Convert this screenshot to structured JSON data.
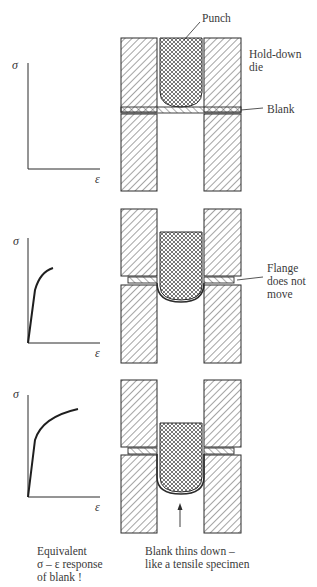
{
  "labels": {
    "punch": "Punch",
    "hold_down_die_line1": "Hold-down",
    "hold_down_die_line2": "die",
    "blank": "Blank",
    "flange_line1": "Flange",
    "flange_line2": "does not",
    "flange_line3": "move"
  },
  "graphs": [
    {
      "y_label": "σ",
      "x_label": "ε",
      "curve": "none"
    },
    {
      "y_label": "σ",
      "x_label": "ε",
      "curve": "partial stress-strain"
    },
    {
      "y_label": "σ",
      "x_label": "ε",
      "curve": "full stress-strain"
    }
  ],
  "captions": {
    "left_line1": "Equivalent",
    "left_line2": "σ – ε response",
    "left_line3": "of blank !",
    "right_line1": "Blank thins down –",
    "right_line2": "like a tensile specimen"
  },
  "stages": [
    {
      "name": "initial",
      "punch_depth": 0
    },
    {
      "name": "partial-draw",
      "punch_depth": 1
    },
    {
      "name": "deep-draw",
      "punch_depth": 2
    }
  ],
  "colors": {
    "line": "#2b2b2b",
    "hatch": "#4a4a4a",
    "background": "#ffffff"
  }
}
